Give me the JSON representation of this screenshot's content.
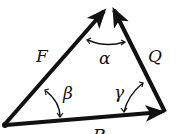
{
  "diagram": {
    "type": "force-triangle",
    "vectors": [
      {
        "name": "F",
        "from": "origin",
        "to": "apex"
      },
      {
        "name": "Q",
        "from": "right-vertex",
        "to": "apex"
      },
      {
        "name": "R",
        "from": "origin",
        "to": "right-vertex"
      }
    ],
    "labels": {
      "F": "F",
      "Q": "Q",
      "R": "R",
      "alpha": "α",
      "beta": "β",
      "gamma": "γ"
    },
    "colors": {
      "stroke": "#111111",
      "background": "#ffffff"
    }
  }
}
